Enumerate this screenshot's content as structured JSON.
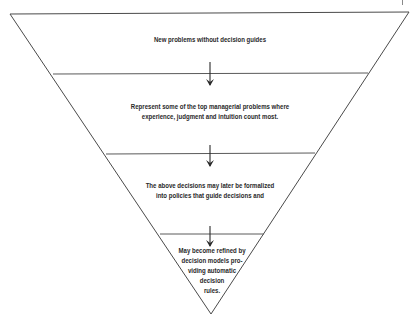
{
  "header": {
    "cut_text": "DECISION MAKING IN MANAGEMENT"
  },
  "diagram": {
    "type": "inverted-pyramid",
    "stroke_color": "#4a4a4a",
    "text_color": "#2a2a2a",
    "levels": [
      {
        "id": "level-1",
        "lines": [
          "New problems without decision guides"
        ]
      },
      {
        "id": "level-2",
        "lines": [
          "Represent some of the top managerial problems where",
          "experience, judgment and intuition count most."
        ]
      },
      {
        "id": "level-3",
        "lines": [
          "The above decisions may later be formalized",
          "into policies that guide decisions and"
        ]
      },
      {
        "id": "level-4",
        "lines": [
          "May become refined by",
          "decision models pro-",
          "viding automatic",
          "decision",
          "rules."
        ]
      }
    ],
    "arrows": [
      {
        "from_level": 1,
        "to_level": 2,
        "icon": "arrow-down-icon"
      },
      {
        "from_level": 2,
        "to_level": 3,
        "icon": "arrow-down-icon"
      },
      {
        "from_level": 3,
        "to_level": 4,
        "icon": "arrow-down-icon"
      }
    ]
  }
}
